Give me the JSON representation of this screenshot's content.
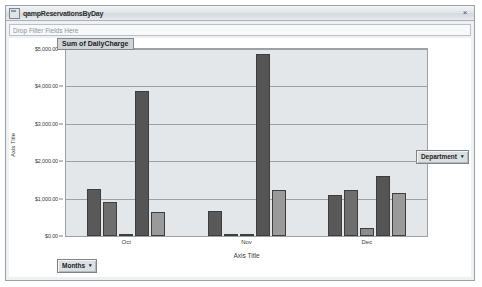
{
  "window": {
    "title": "qampReservationsByDay",
    "close_label": "×",
    "icon": "pivotchart-icon"
  },
  "filter_bar": {
    "placeholder": "Drop Filter Fields Here"
  },
  "field_buttons": {
    "department": {
      "label": "Department",
      "caret": "▾"
    },
    "months": {
      "label": "Months",
      "caret": "▾"
    }
  },
  "chart_data": {
    "type": "bar",
    "title": "Sum of DailyCharge",
    "xlabel": "Axis Title",
    "ylabel": "Axis Title",
    "categories": [
      "Oct",
      "Nov",
      "Dec"
    ],
    "ylim": [
      0,
      5000
    ],
    "ytick_labels": [
      "$5,000.00",
      "$4,000.00",
      "$3,000.00",
      "$2,000.00",
      "$1,000.00",
      "$0.00"
    ],
    "ytick_values": [
      5000,
      4000,
      3000,
      2000,
      1000,
      0
    ],
    "grid": true,
    "legend": "none",
    "series": [
      {
        "name": "Series 1",
        "color": "#595959",
        "values": [
          1260,
          680,
          1090
        ]
      },
      {
        "name": "Series 2",
        "color": "#6e6e6e",
        "values": [
          920,
          0,
          1240
        ]
      },
      {
        "name": "Series 3",
        "color": "#8c8c8c",
        "values": [
          0,
          0,
          210
        ]
      },
      {
        "name": "Series 4",
        "color": "#555555",
        "values": [
          3870,
          4880,
          1610
        ]
      },
      {
        "name": "Series 5",
        "color": "#9a9a9a",
        "values": [
          640,
          1220,
          1150
        ]
      }
    ]
  }
}
